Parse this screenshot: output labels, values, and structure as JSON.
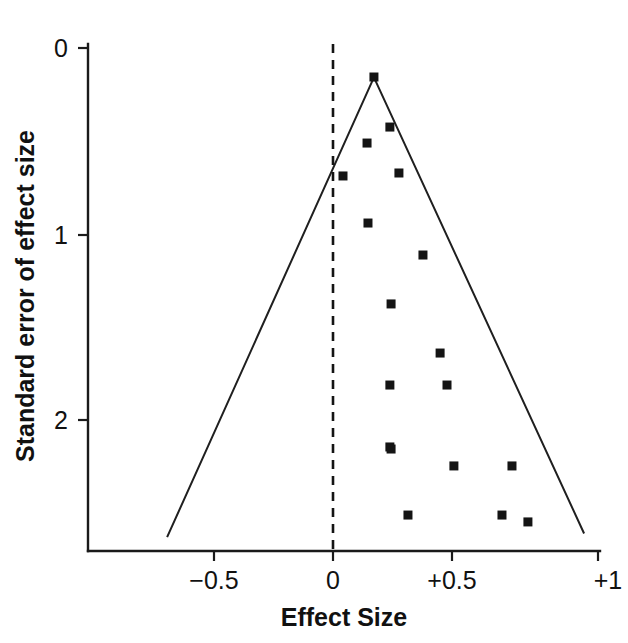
{
  "chart_data": {
    "type": "scatter",
    "title": "",
    "subtitle": "",
    "xlabel": "Effect Size",
    "ylabel": "Standard error of effect size",
    "xlim": [
      -0.72,
      1.04
    ],
    "ylim": [
      2.75,
      -0.05
    ],
    "y_axis_inverted": true,
    "grid": false,
    "legend": null,
    "x_ticks": [
      {
        "value": -0.5,
        "label": "−0.5"
      },
      {
        "value": 0,
        "label": "0"
      },
      {
        "value": 0.5,
        "label": "+0.5"
      },
      {
        "value": 1,
        "label": "+1"
      }
    ],
    "y_ticks": [
      {
        "value": 0,
        "label": "0"
      },
      {
        "value": 1,
        "label": "1"
      },
      {
        "value": 2,
        "label": "2"
      }
    ],
    "reference_line": {
      "name": "null-effect-line",
      "orientation": "vertical",
      "x": 0,
      "style": "dashed"
    },
    "funnel_contour": {
      "name": "pseudo-95-confidence-funnel",
      "apex": {
        "x": 0.172,
        "y": 0.158
      },
      "left_base": {
        "x": -0.697,
        "y": 2.63
      },
      "right_base": {
        "x": 1.055,
        "y": 2.61
      },
      "style": "solid"
    },
    "points": [
      {
        "x": 0.172,
        "y": 0.156
      },
      {
        "x": 0.239,
        "y": 0.425
      },
      {
        "x": 0.143,
        "y": 0.511
      },
      {
        "x": 0.277,
        "y": 0.672
      },
      {
        "x": 0.042,
        "y": 0.688
      },
      {
        "x": 0.147,
        "y": 0.941
      },
      {
        "x": 0.378,
        "y": 1.113
      },
      {
        "x": 0.244,
        "y": 1.376
      },
      {
        "x": 0.45,
        "y": 1.64
      },
      {
        "x": 0.239,
        "y": 1.812
      },
      {
        "x": 0.479,
        "y": 1.812
      },
      {
        "x": 0.239,
        "y": 2.145
      },
      {
        "x": 0.244,
        "y": 2.156
      },
      {
        "x": 0.508,
        "y": 2.247
      },
      {
        "x": 0.752,
        "y": 2.247
      },
      {
        "x": 0.315,
        "y": 2.511
      },
      {
        "x": 0.71,
        "y": 2.511
      },
      {
        "x": 0.819,
        "y": 2.548
      }
    ],
    "marker": {
      "shape": "square",
      "color": "#141414",
      "size_px": 9
    }
  }
}
